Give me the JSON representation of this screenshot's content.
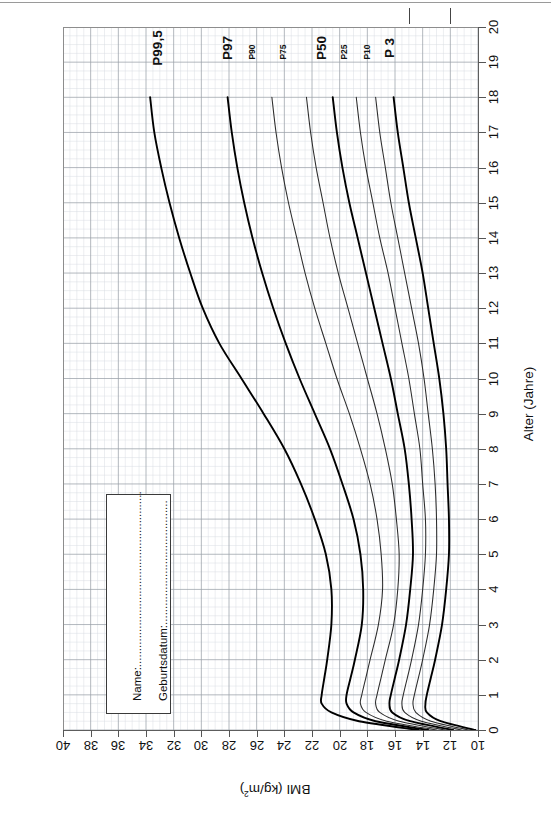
{
  "title": "Perzentilkurven für den Body Mass Index (Jungen 0 - 18 Jahre)",
  "axes": {
    "bmi_label": "BMI (kg/m",
    "bmi_label_sup": "2",
    "bmi_label_close": ")",
    "age_label": "Alter (Jahre)",
    "bmi_ticks": [
      40,
      38,
      36,
      34,
      32,
      30,
      28,
      26,
      24,
      22,
      20,
      18,
      16,
      14,
      12,
      10
    ],
    "age_ticks": [
      0,
      1,
      2,
      3,
      4,
      5,
      6,
      7,
      8,
      9,
      10,
      11,
      12,
      13,
      14,
      15,
      16,
      17,
      18,
      19,
      20
    ]
  },
  "id_box": {
    "name_label": "Name:...........................................................",
    "dob_label": "Geburtsdatum:......................................."
  },
  "colors": {
    "curve": "#2b2b2b",
    "curve_bold": "#000000",
    "grid_minor": "#d8dce2",
    "grid_major": "#9aa0a8",
    "axis": "#555555",
    "text": "#111111"
  },
  "chart_data": {
    "type": "line",
    "title": "Perzentilkurven für den Body Mass Index (Jungen 0 - 18 Jahre)",
    "xlabel": "Alter (Jahre)",
    "ylabel": "BMI (kg/m2)",
    "xlim": [
      0,
      20
    ],
    "ylim": [
      10,
      40
    ],
    "grid": true,
    "legend": "inline-curve-labels",
    "orientation": "rotated-90-age-vertical-bmi-horizontal",
    "x": [
      0,
      0.25,
      0.5,
      0.75,
      1,
      1.5,
      2,
      3,
      4,
      5,
      6,
      7,
      8,
      9,
      10,
      11,
      12,
      13,
      14,
      15,
      16,
      17,
      18
    ],
    "series": [
      {
        "name": "P99,5",
        "bold": true,
        "values": [
          14.3,
          18.6,
          20.6,
          21.3,
          21.3,
          21.1,
          20.9,
          20.6,
          20.6,
          21.0,
          21.8,
          22.8,
          24.0,
          25.5,
          27.1,
          28.7,
          29.9,
          30.8,
          31.6,
          32.3,
          32.9,
          33.4,
          33.7
        ]
      },
      {
        "name": "P97",
        "bold": true,
        "values": [
          13.6,
          17.4,
          19.0,
          19.5,
          19.5,
          19.2,
          18.9,
          18.4,
          18.3,
          18.5,
          19.0,
          19.8,
          20.7,
          21.8,
          22.9,
          23.9,
          24.8,
          25.6,
          26.3,
          26.9,
          27.4,
          27.8,
          28.1
        ]
      },
      {
        "name": "P90",
        "bold": false,
        "values": [
          13.0,
          16.6,
          18.1,
          18.5,
          18.4,
          18.1,
          17.8,
          17.2,
          16.9,
          17.0,
          17.3,
          17.8,
          18.5,
          19.3,
          20.2,
          21.0,
          21.8,
          22.5,
          23.1,
          23.7,
          24.2,
          24.6,
          24.9
        ]
      },
      {
        "name": "P75",
        "bold": false,
        "values": [
          12.4,
          15.7,
          17.1,
          17.4,
          17.3,
          17.0,
          16.7,
          16.1,
          15.8,
          15.7,
          15.9,
          16.2,
          16.7,
          17.3,
          18.0,
          18.7,
          19.4,
          20.1,
          20.7,
          21.2,
          21.7,
          22.1,
          22.4
        ]
      },
      {
        "name": "P50",
        "bold": true,
        "values": [
          11.8,
          14.9,
          16.2,
          16.4,
          16.3,
          16.0,
          15.7,
          15.2,
          14.9,
          14.7,
          14.8,
          15.0,
          15.3,
          15.8,
          16.3,
          16.9,
          17.5,
          18.1,
          18.7,
          19.3,
          19.8,
          20.2,
          20.5
        ]
      },
      {
        "name": "P25",
        "bold": false,
        "values": [
          11.2,
          14.1,
          15.3,
          15.5,
          15.4,
          15.1,
          14.8,
          14.3,
          14.0,
          13.8,
          13.8,
          14.0,
          14.2,
          14.6,
          15.0,
          15.5,
          16.0,
          16.5,
          17.1,
          17.6,
          18.1,
          18.5,
          18.8
        ]
      },
      {
        "name": "P10",
        "bold": false,
        "values": [
          10.7,
          13.4,
          14.5,
          14.7,
          14.6,
          14.3,
          14.0,
          13.5,
          13.2,
          13.0,
          13.0,
          13.1,
          13.3,
          13.6,
          13.9,
          14.3,
          14.8,
          15.3,
          15.8,
          16.3,
          16.7,
          17.1,
          17.4
        ]
      },
      {
        "name": "P 3",
        "bold": true,
        "values": [
          10.2,
          12.7,
          13.7,
          13.8,
          13.7,
          13.4,
          13.1,
          12.6,
          12.3,
          12.1,
          12.1,
          12.2,
          12.3,
          12.5,
          12.8,
          13.2,
          13.6,
          14.0,
          14.5,
          15.0,
          15.4,
          15.8,
          16.1
        ]
      }
    ],
    "curve_label_positions": [
      {
        "name": "P99,5",
        "x_px": 158,
        "y_px": 48,
        "size": "big"
      },
      {
        "name": "P97",
        "x_px": 228,
        "y_px": 48,
        "size": "big"
      },
      {
        "name": "P90",
        "x_px": 252,
        "y_px": 52,
        "size": "small"
      },
      {
        "name": "P75",
        "x_px": 283,
        "y_px": 52,
        "size": "small"
      },
      {
        "name": "P50",
        "x_px": 322,
        "y_px": 48,
        "size": "big"
      },
      {
        "name": "P25",
        "x_px": 344,
        "y_px": 52,
        "size": "small"
      },
      {
        "name": "P10",
        "x_px": 367,
        "y_px": 52,
        "size": "small"
      },
      {
        "name": "P 3",
        "x_px": 390,
        "y_px": 48,
        "size": "big"
      }
    ]
  }
}
